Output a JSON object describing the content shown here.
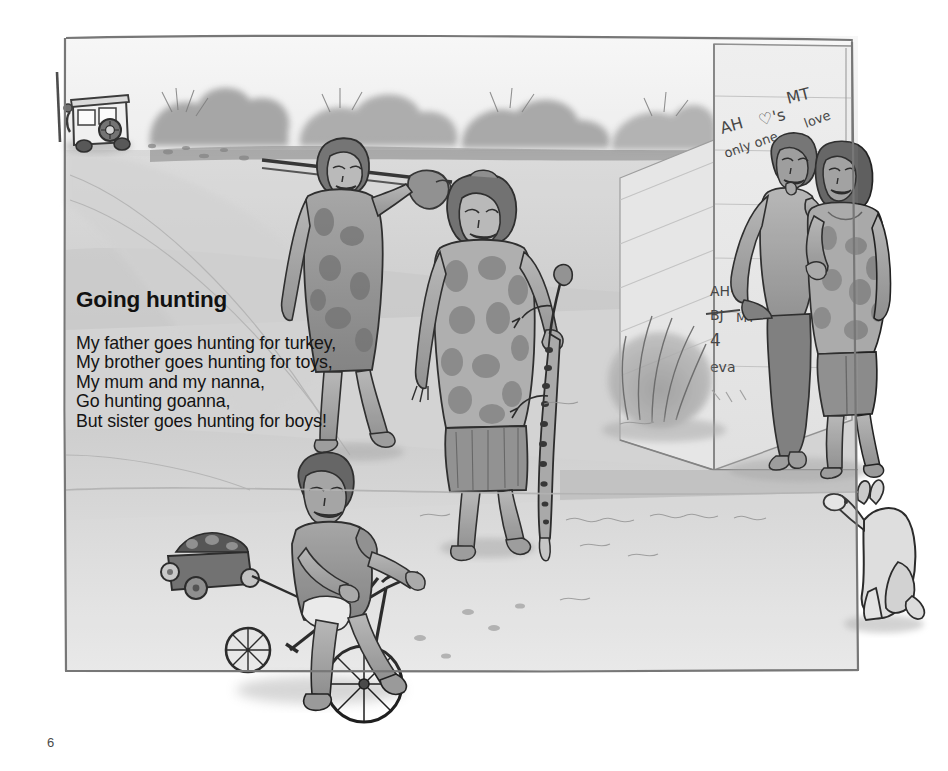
{
  "page": {
    "number": "6",
    "background_color": "#ffffff",
    "width": 948,
    "height": 771
  },
  "poem": {
    "title": "Going hunting",
    "lines": [
      "My father goes hunting for turkey,",
      "My brother goes hunting for toys,",
      "My mum and my nanna,",
      "Go hunting goanna,",
      "But sister goes hunting for boys!"
    ],
    "title_color": "#111111",
    "text_color": "#141414"
  },
  "illustration": {
    "description": "Grey-wash ink drawing of a remote community dirt road: two women walking back from hunting, a small boy on a tricycle towing a toy trailer, a teenage couple leaning on a graffitied wall, and a camp dog sitting at right.",
    "style": "pencil-and-grey-wash line illustration",
    "frame": {
      "name": "hand-drawn-border",
      "color": "#6e6e6e",
      "left": 65,
      "top": 35,
      "right": 858,
      "bottom": 672
    },
    "palette": {
      "sky": "#f4f4f4",
      "road_light": "#e0e0e0",
      "road_mid": "#c8c8c8",
      "road_dark": "#a8a8a8",
      "vegetation": "#9a9a9a",
      "wall": "#ededed",
      "wash_shadow": "#b4b4b4",
      "ink": "#2c2c2c"
    },
    "graffiti": {
      "upper": [
        "AH",
        "♡'s",
        "MT",
        "only one",
        "love"
      ],
      "lower": [
        "AH+",
        "BJ",
        "MT",
        "4",
        "eva"
      ],
      "ink_color": "#3b3b3b"
    },
    "figures": [
      {
        "name": "four-wheel-drive-vehicle",
        "label": "4WD on dirt road"
      },
      {
        "name": "woman-with-pole-and-turkey",
        "label": "woman carrying pole with turkey"
      },
      {
        "name": "woman-with-goanna",
        "label": "woman holding goanna by the tail"
      },
      {
        "name": "boy-on-tricycle",
        "label": "boy riding tricycle towing toy trailer"
      },
      {
        "name": "toy-trailer",
        "label": "small trailer loaded with toys"
      },
      {
        "name": "teenage-boy",
        "label": "teenage boy leaning on wall"
      },
      {
        "name": "teenage-girl",
        "label": "teenage girl beside him"
      },
      {
        "name": "camp-dog",
        "label": "dog sitting on the ground"
      },
      {
        "name": "graffiti-wall",
        "label": "concrete wall with love-heart graffiti"
      },
      {
        "name": "roadside-bush",
        "label": "clump of grass at wall corner"
      }
    ]
  }
}
